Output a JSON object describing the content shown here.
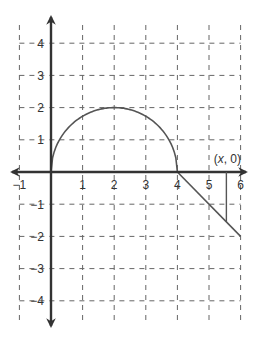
{
  "chart_data": {
    "type": "line",
    "title": "",
    "xlabel": "",
    "ylabel": "",
    "xlim": [
      -1,
      6
    ],
    "ylim": [
      -4,
      4
    ],
    "grid": true,
    "grid_style": "dashed",
    "x_ticks": [
      -1,
      1,
      2,
      3,
      4,
      5,
      6
    ],
    "y_ticks": [
      4,
      3,
      2,
      1,
      -1,
      -2,
      -3,
      -4
    ],
    "x_tick_labels": [
      "−1",
      "1",
      "2",
      "3",
      "4",
      "5",
      "6"
    ],
    "y_tick_labels": [
      "4",
      "3",
      "2",
      "1",
      "−1",
      "−2",
      "−3",
      "−4"
    ],
    "series": [
      {
        "name": "semicircle",
        "description": "upper semicircle centered at (2, 0) with radius 2",
        "equation": "y = sqrt(4 - (x - 2)^2)",
        "domain": [
          0,
          4
        ],
        "points": [
          [
            0,
            0
          ],
          [
            0.5,
            1.32
          ],
          [
            1,
            1.73
          ],
          [
            2,
            2
          ],
          [
            3,
            1.73
          ],
          [
            3.5,
            1.32
          ],
          [
            4,
            0
          ]
        ]
      },
      {
        "name": "line",
        "description": "line segment from (4, 0) to (6, -2)",
        "equation": "y = -(x - 4)",
        "domain": [
          4,
          6
        ],
        "points": [
          [
            4,
            0
          ],
          [
            6,
            -2
          ]
        ]
      }
    ],
    "annotations": [
      {
        "text": "(x, 0)",
        "point": [
          5.55,
          0
        ],
        "description": "point on x-axis with vertical segment down to the line",
        "segment": [
          [
            5.55,
            0
          ],
          [
            5.55,
            -1.55
          ]
        ]
      }
    ]
  },
  "labels": {
    "annotation_open": "(",
    "annotation_x": "x",
    "annotation_rest": ", 0)"
  },
  "colors": {
    "axis": "#333333",
    "grid": "#666666",
    "curve": "#555555"
  }
}
